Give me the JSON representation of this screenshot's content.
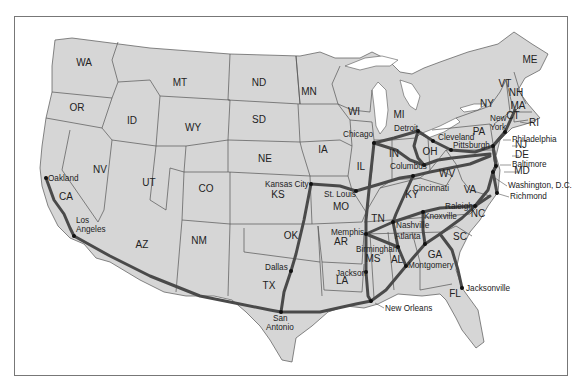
{
  "map": {
    "title": "United States rail routes map",
    "colors": {
      "land": "#d6d6d6",
      "border": "#555555",
      "route": "#4a4a4a",
      "water": "#ffffff"
    },
    "states": [
      {
        "abbr": "WA",
        "x": 84,
        "y": 66
      },
      {
        "abbr": "OR",
        "x": 77,
        "y": 111
      },
      {
        "abbr": "CA",
        "x": 66,
        "y": 200
      },
      {
        "abbr": "NV",
        "x": 100,
        "y": 173
      },
      {
        "abbr": "ID",
        "x": 132,
        "y": 124
      },
      {
        "abbr": "MT",
        "x": 180,
        "y": 86
      },
      {
        "abbr": "WY",
        "x": 193,
        "y": 131
      },
      {
        "abbr": "UT",
        "x": 149,
        "y": 186
      },
      {
        "abbr": "CO",
        "x": 206,
        "y": 192
      },
      {
        "abbr": "AZ",
        "x": 142,
        "y": 248
      },
      {
        "abbr": "NM",
        "x": 199,
        "y": 244
      },
      {
        "abbr": "ND",
        "x": 259,
        "y": 86
      },
      {
        "abbr": "SD",
        "x": 259,
        "y": 123
      },
      {
        "abbr": "NE",
        "x": 265,
        "y": 162
      },
      {
        "abbr": "KS",
        "x": 278,
        "y": 198
      },
      {
        "abbr": "OK",
        "x": 291,
        "y": 239
      },
      {
        "abbr": "TX",
        "x": 269,
        "y": 289
      },
      {
        "abbr": "MN",
        "x": 309,
        "y": 95
      },
      {
        "abbr": "IA",
        "x": 323,
        "y": 153
      },
      {
        "abbr": "MO",
        "x": 341,
        "y": 210
      },
      {
        "abbr": "AR",
        "x": 341,
        "y": 245
      },
      {
        "abbr": "LA",
        "x": 342,
        "y": 284
      },
      {
        "abbr": "WI",
        "x": 354,
        "y": 115
      },
      {
        "abbr": "IL",
        "x": 361,
        "y": 170
      },
      {
        "abbr": "MI",
        "x": 399,
        "y": 118
      },
      {
        "abbr": "IN",
        "x": 394,
        "y": 157
      },
      {
        "abbr": "OH",
        "x": 430,
        "y": 155
      },
      {
        "abbr": "KY",
        "x": 412,
        "y": 198
      },
      {
        "abbr": "TN",
        "x": 378,
        "y": 222
      },
      {
        "abbr": "MS",
        "x": 373,
        "y": 262
      },
      {
        "abbr": "AL",
        "x": 397,
        "y": 263
      },
      {
        "abbr": "GA",
        "x": 435,
        "y": 258
      },
      {
        "abbr": "FL",
        "x": 455,
        "y": 297
      },
      {
        "abbr": "SC",
        "x": 460,
        "y": 240
      },
      {
        "abbr": "NC",
        "x": 478,
        "y": 217
      },
      {
        "abbr": "VA",
        "x": 470,
        "y": 193
      },
      {
        "abbr": "WV",
        "x": 447,
        "y": 177
      },
      {
        "abbr": "PA",
        "x": 479,
        "y": 135
      },
      {
        "abbr": "NY",
        "x": 487,
        "y": 107
      },
      {
        "abbr": "VT",
        "x": 505,
        "y": 87
      },
      {
        "abbr": "NH",
        "x": 516,
        "y": 96
      },
      {
        "abbr": "ME",
        "x": 530,
        "y": 63
      },
      {
        "abbr": "MA",
        "x": 518,
        "y": 109
      },
      {
        "abbr": "CT",
        "x": 513,
        "y": 119
      },
      {
        "abbr": "RI",
        "x": 534,
        "y": 126
      },
      {
        "abbr": "NJ",
        "x": 521,
        "y": 148
      },
      {
        "abbr": "DE",
        "x": 522,
        "y": 158
      },
      {
        "abbr": "MD",
        "x": 522,
        "y": 174
      }
    ],
    "cities": [
      {
        "name": "Oakland",
        "x": 46,
        "y": 178,
        "lx": 48,
        "ly": 181
      },
      {
        "name": "Los",
        "x": 74,
        "y": 236,
        "lx": 76,
        "ly": 223
      },
      {
        "name": "Angeles",
        "x": 74,
        "y": 236,
        "lx": 76,
        "ly": 232
      },
      {
        "name": "Dallas",
        "x": 291,
        "y": 271,
        "lx": 265,
        "ly": 270
      },
      {
        "name": "San",
        "x": 281,
        "y": 312,
        "lx": 273,
        "ly": 321
      },
      {
        "name": "Antonio",
        "x": 281,
        "y": 312,
        "lx": 266,
        "ly": 330
      },
      {
        "name": "Kansas City",
        "x": 311,
        "y": 184,
        "lx": 265,
        "ly": 187
      },
      {
        "name": "St. Louis",
        "x": 356,
        "y": 191,
        "lx": 324,
        "ly": 197
      },
      {
        "name": "Chicago",
        "x": 374,
        "y": 143,
        "lx": 343,
        "ly": 137
      },
      {
        "name": "Memphis",
        "x": 366,
        "y": 234,
        "lx": 331,
        "ly": 235
      },
      {
        "name": "Jackson",
        "x": 366,
        "y": 272,
        "lx": 336,
        "ly": 276
      },
      {
        "name": "New Orleans",
        "x": 371,
        "y": 301,
        "lx": 385,
        "ly": 311
      },
      {
        "name": "Birmingham",
        "x": 398,
        "y": 247,
        "lx": 356,
        "ly": 252
      },
      {
        "name": "Montgomery",
        "x": 406,
        "y": 266,
        "lx": 408,
        "ly": 268
      },
      {
        "name": "Atlanta",
        "x": 425,
        "y": 244,
        "lx": 395,
        "ly": 239
      },
      {
        "name": "Nashville",
        "x": 393,
        "y": 222,
        "lx": 396,
        "ly": 228
      },
      {
        "name": "Knoxville",
        "x": 423,
        "y": 212,
        "lx": 424,
        "ly": 219
      },
      {
        "name": "Cincinnati",
        "x": 413,
        "y": 176,
        "lx": 413,
        "ly": 191
      },
      {
        "name": "Columbus",
        "x": 424,
        "y": 165,
        "lx": 390,
        "ly": 169
      },
      {
        "name": "Detroit",
        "x": 418,
        "y": 131,
        "lx": 394,
        "ly": 131
      },
      {
        "name": "Cleveland",
        "x": 433,
        "y": 141,
        "lx": 438,
        "ly": 140
      },
      {
        "name": "Pittsburgh",
        "x": 451,
        "y": 150,
        "lx": 453,
        "ly": 148
      },
      {
        "name": "Jacksonville",
        "x": 462,
        "y": 288,
        "lx": 466,
        "ly": 291
      },
      {
        "name": "Raleigh",
        "x": 475,
        "y": 206,
        "lx": 445,
        "ly": 209
      },
      {
        "name": "Richmond",
        "x": 497,
        "y": 193,
        "lx": 510,
        "ly": 199
      },
      {
        "name": "Washington, D.C.",
        "x": 493,
        "y": 172,
        "lx": 508,
        "ly": 188
      },
      {
        "name": "Baltimore",
        "x": 496,
        "y": 166,
        "lx": 512,
        "ly": 167
      },
      {
        "name": "Philadelphia",
        "x": 493,
        "y": 146,
        "lx": 512,
        "ly": 142
      },
      {
        "name": "New",
        "x": 505,
        "y": 132,
        "lx": 490,
        "ly": 121
      },
      {
        "name": "York",
        "x": 505,
        "y": 132,
        "lx": 490,
        "ly": 130
      }
    ]
  }
}
